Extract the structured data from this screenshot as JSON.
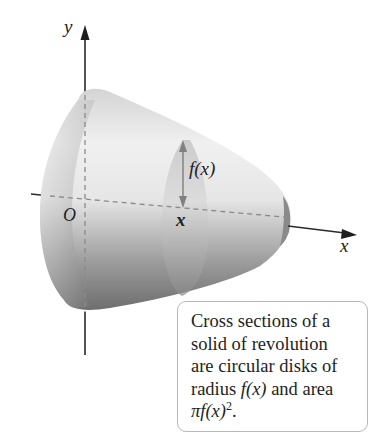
{
  "figure": {
    "axes": {
      "y_label": "y",
      "x_label": "x",
      "origin_label": "O"
    },
    "cross_section": {
      "position_label": "x",
      "radius_label": "f(x)"
    },
    "callout": {
      "lines": [
        "Cross sections of a",
        "solid of revolution",
        "are circular disks of"
      ],
      "line4_prefix": "radius ",
      "line4_math": "f(x)",
      "line4_suffix": " and area",
      "line5_math": "πf(x)",
      "line5_sup": "2",
      "line5_suffix": "."
    },
    "colors": {
      "solid_light": "#f2f2f2",
      "solid_dark": "#6f6f6f",
      "axis": "#2a2a2a",
      "dashed": "#8a8a8a",
      "border": "#b8b8b8"
    }
  }
}
